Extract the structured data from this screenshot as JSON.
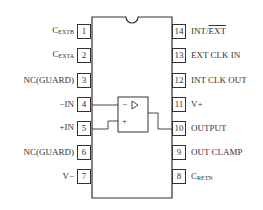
{
  "diagram": {
    "type": "ic-pinout",
    "package": "14-pin DIP",
    "colors": {
      "stroke": "#333333",
      "background": "#ffffff"
    },
    "left_pins": [
      {
        "number": "1",
        "label_main": "C",
        "label_sub": "EXTB"
      },
      {
        "number": "2",
        "label_main": "C",
        "label_sub": "EXTA"
      },
      {
        "number": "3",
        "label_main": "NC(GUARD)",
        "label_sub": ""
      },
      {
        "number": "4",
        "label_main": "−IN",
        "label_sub": ""
      },
      {
        "number": "5",
        "label_main": "+IN",
        "label_sub": ""
      },
      {
        "number": "6",
        "label_main": "NC(GUARD)",
        "label_sub": ""
      },
      {
        "number": "7",
        "label_main": "V−",
        "label_sub": ""
      }
    ],
    "right_pins": [
      {
        "number": "14",
        "label_main": "INT/",
        "label_over": "EXT",
        "label_sub": ""
      },
      {
        "number": "13",
        "label_main": "EXT CLK IN",
        "label_sub": ""
      },
      {
        "number": "12",
        "label_main": "INT CLK OUT",
        "label_sub": ""
      },
      {
        "number": "11",
        "label_main": "V+",
        "label_sub": ""
      },
      {
        "number": "10",
        "label_main": "OUTPUT",
        "label_sub": ""
      },
      {
        "number": "9",
        "label_main": "OUT CLAMP",
        "label_sub": ""
      },
      {
        "number": "8",
        "label_main": "C",
        "label_sub": "RETN"
      }
    ],
    "amplifier": {
      "minus_sign": "−",
      "plus_sign": "+",
      "symbol": "triangle-amplifier"
    }
  }
}
